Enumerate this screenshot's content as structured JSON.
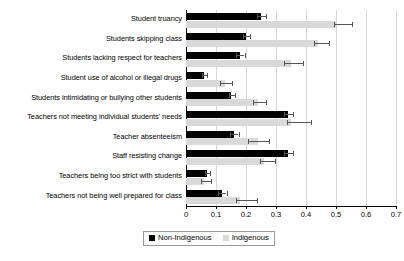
{
  "chart_data": {
    "type": "bar",
    "orientation": "horizontal",
    "title": "",
    "subtitle": "",
    "xlabel": "",
    "ylabel": "",
    "xlim": [
      0,
      0.7
    ],
    "xticks": [
      "0",
      "0.1",
      "0.2",
      "0.3",
      "0.4",
      "0.5",
      "0.6",
      "0.7"
    ],
    "xtick_values": [
      0,
      0.1,
      0.2,
      0.3,
      0.4,
      0.5,
      0.6,
      0.7
    ],
    "grid": true,
    "grid_axis": "x",
    "legend_position": "bottom-center",
    "categories": [
      "Student truancy",
      "Students skipping class",
      "Students lacking respect for teachers",
      "Student use of alcohol or illegal drugs",
      "Students intimidating or bullying other students",
      "Teachers not meeting individual students' needs",
      "Teacher absenteeism",
      "Staff resisting change",
      "Teachers being too strict with students",
      "Teachers not being well prepared for class"
    ],
    "series": [
      {
        "name": "Non-Indigenous",
        "color": "#000000",
        "values": [
          0.25,
          0.2,
          0.18,
          0.06,
          0.15,
          0.34,
          0.16,
          0.34,
          0.07,
          0.12
        ],
        "errors_low": [
          0.235,
          0.19,
          0.168,
          0.052,
          0.142,
          0.325,
          0.148,
          0.325,
          0.062,
          0.108
        ],
        "errors_high": [
          0.268,
          0.213,
          0.195,
          0.07,
          0.162,
          0.358,
          0.175,
          0.357,
          0.08,
          0.135
        ]
      },
      {
        "name": "Indigenous",
        "color": "#d9d9d9",
        "values": [
          0.5,
          0.44,
          0.35,
          0.13,
          0.24,
          0.35,
          0.24,
          0.26,
          0.06,
          0.18
        ],
        "errors_low": [
          0.492,
          0.425,
          0.325,
          0.112,
          0.222,
          0.335,
          0.208,
          0.245,
          0.05,
          0.165
        ],
        "errors_high": [
          0.553,
          0.478,
          0.39,
          0.152,
          0.268,
          0.418,
          0.278,
          0.298,
          0.082,
          0.235
        ]
      }
    ]
  },
  "legend": {
    "items": [
      {
        "label": "Non-Indigenous",
        "swatch": "dark"
      },
      {
        "label": "Indigenous",
        "swatch": "light"
      }
    ]
  }
}
